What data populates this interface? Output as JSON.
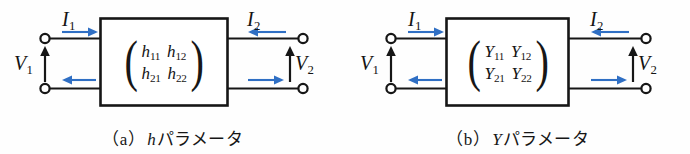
{
  "figure": {
    "background_color": "#fefefe",
    "line_color": "#161616",
    "arrow_color": "#2f6fc4",
    "diagrams": [
      {
        "id": "diagram-a",
        "caption_paren_open": "（",
        "caption_letter": "a",
        "caption_paren_close": "）",
        "caption_symbol": "h",
        "caption_text": "パラメータ",
        "caption_full": "（a） h パラメータ",
        "matrix": {
          "open_paren": "(",
          "close_paren": ")",
          "rows": [
            [
              {
                "base": "h",
                "sub": "11"
              },
              {
                "base": "h",
                "sub": "12"
              }
            ],
            [
              {
                "base": "h",
                "sub": "21"
              },
              {
                "base": "h",
                "sub": "22"
              }
            ]
          ]
        },
        "ports": [
          {
            "name": "current-in-label",
            "base": "I",
            "sub": "1",
            "arrow": "right"
          },
          {
            "name": "current-out-label",
            "base": "I",
            "sub": "2",
            "arrow": "left"
          },
          {
            "name": "voltage-in-label",
            "base": "V",
            "sub": "1",
            "arrow": "up"
          },
          {
            "name": "voltage-out-label",
            "base": "V",
            "sub": "2",
            "arrow": "up"
          }
        ]
      },
      {
        "id": "diagram-b",
        "caption_paren_open": "（",
        "caption_letter": "b",
        "caption_paren_close": "）",
        "caption_symbol": "Y",
        "caption_text": "パラメータ",
        "caption_full": "（b） Y パラメータ",
        "matrix": {
          "open_paren": "(",
          "close_paren": ")",
          "rows": [
            [
              {
                "base": "Y",
                "sub": "11"
              },
              {
                "base": "Y",
                "sub": "12"
              }
            ],
            [
              {
                "base": "Y",
                "sub": "21"
              },
              {
                "base": "Y",
                "sub": "22"
              }
            ]
          ]
        },
        "ports": [
          {
            "name": "current-in-label",
            "base": "I",
            "sub": "1",
            "arrow": "right"
          },
          {
            "name": "current-out-label",
            "base": "I",
            "sub": "2",
            "arrow": "left"
          },
          {
            "name": "voltage-in-label",
            "base": "V",
            "sub": "1",
            "arrow": "up"
          },
          {
            "name": "voltage-out-label",
            "base": "V",
            "sub": "2",
            "arrow": "up"
          }
        ]
      }
    ]
  },
  "labels": {
    "a": {
      "i1": {
        "base": "I",
        "sub": "1"
      },
      "i2": {
        "base": "I",
        "sub": "2"
      },
      "v1": {
        "base": "V",
        "sub": "1"
      },
      "v2": {
        "base": "V",
        "sub": "2"
      }
    },
    "b": {
      "i1": {
        "base": "I",
        "sub": "1"
      },
      "i2": {
        "base": "I",
        "sub": "2"
      },
      "v1": {
        "base": "V",
        "sub": "1"
      },
      "v2": {
        "base": "V",
        "sub": "2"
      }
    }
  },
  "matrix_a": {
    "r0c0": {
      "base": "h",
      "sub": "11"
    },
    "r0c1": {
      "base": "h",
      "sub": "12"
    },
    "r1c0": {
      "base": "h",
      "sub": "21"
    },
    "r1c1": {
      "base": "h",
      "sub": "22"
    },
    "open": "(",
    "close": ")"
  },
  "matrix_b": {
    "r0c0": {
      "base": "Y",
      "sub": "11"
    },
    "r0c1": {
      "base": "Y",
      "sub": "12"
    },
    "r1c0": {
      "base": "Y",
      "sub": "21"
    },
    "r1c1": {
      "base": "Y",
      "sub": "22"
    },
    "open": "(",
    "close": ")"
  },
  "caption_a": {
    "paren_open": "（",
    "letter": "a",
    "paren_close": "）",
    "symbol": "h",
    "text": "パラメータ"
  },
  "caption_b": {
    "paren_open": "（",
    "letter": "b",
    "paren_close": "）",
    "symbol": "Y",
    "text": "パラメータ"
  }
}
